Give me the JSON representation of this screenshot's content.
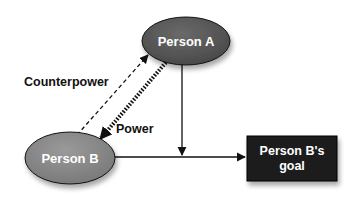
{
  "diagram": {
    "type": "relationship",
    "nodes": [
      {
        "id": "person_a",
        "label": "Person A",
        "shape": "ellipse",
        "fill": "#5a5a5a"
      },
      {
        "id": "person_b",
        "label": "Person B",
        "shape": "ellipse",
        "fill": "#8a8a8a"
      },
      {
        "id": "goal",
        "label_line1": "Person B's",
        "label_line2": "goal",
        "shape": "rectangle",
        "fill": "#1a1a1a"
      }
    ],
    "edges": [
      {
        "from": "person_b",
        "to": "person_a",
        "label": "Counterpower",
        "style": "dashed"
      },
      {
        "from": "person_a",
        "to": "person_b",
        "label": "Power",
        "style": "thick-dotted"
      },
      {
        "from": "person_a",
        "to": "person_b_goal_line",
        "label": "",
        "style": "solid"
      },
      {
        "from": "person_b",
        "to": "goal",
        "label": "",
        "style": "solid"
      }
    ]
  },
  "labels": {
    "person_a": "Person A",
    "person_b": "Person B",
    "goal_line1": "Person B's",
    "goal_line2": "goal",
    "counterpower": "Counterpower",
    "power": "Power"
  },
  "colors": {
    "person_a_fill": "#5a5a5a",
    "person_b_fill": "#8a8a8a",
    "goal_fill": "#1a1a1a",
    "line": "#111111"
  }
}
